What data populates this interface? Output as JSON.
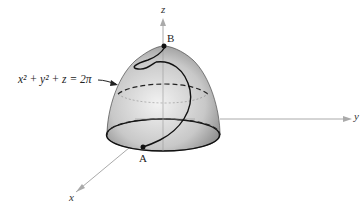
{
  "figure": {
    "equation": "x² + y² + z = 2π",
    "axes": {
      "x": "x",
      "y": "y",
      "z": "z"
    },
    "points": {
      "top": "B",
      "bottom": "A"
    },
    "colors": {
      "axis": "#aaaaaa",
      "surface_light": "#e6e6e6",
      "surface_dark": "#8c8c8c",
      "curve": "#111111"
    }
  }
}
